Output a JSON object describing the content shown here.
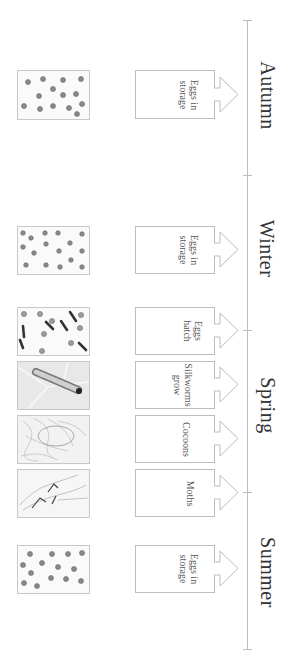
{
  "diagram": {
    "orientation": "rotated-90deg",
    "line_color": "#bdbdbd",
    "seasons": [
      {
        "label": "Autumn",
        "center_y": 95
      },
      {
        "label": "Winter",
        "center_y": 248
      },
      {
        "label": "Spring",
        "center_y": 405
      },
      {
        "label": "Summer",
        "center_y": 572
      }
    ],
    "ticks_y": [
      20,
      175,
      330,
      492,
      650
    ],
    "stages": [
      {
        "season": "Autumn",
        "label": "Eggs in\nstorage",
        "photo": "eggs",
        "top": 70,
        "height": 49
      },
      {
        "season": "Winter",
        "label": "Eggs in\nstorage",
        "photo": "eggs",
        "top": 226,
        "height": 48
      },
      {
        "season": "Spring",
        "label": "Eggs\nhatch",
        "photo": "hatching-eggs",
        "top": 317,
        "height": 48
      },
      {
        "season": "Spring",
        "label": "Silkworms\ngrow",
        "photo": "silkworm",
        "top": 371,
        "height": 48
      },
      {
        "season": "Spring",
        "label": "Cocoons",
        "photo": "cocoon",
        "top": 425,
        "height": 48
      },
      {
        "season": "Spring",
        "label": "Moths",
        "photo": "moths",
        "top": 479,
        "height": 48
      },
      {
        "season": "Summer",
        "label": "Eggs in\nstorage",
        "photo": "eggs",
        "top": 544,
        "height": 48
      }
    ]
  }
}
